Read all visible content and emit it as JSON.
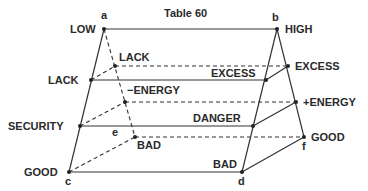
{
  "title": "Table 60",
  "points": {
    "a": "a",
    "b": "b",
    "c": "c",
    "d": "d",
    "e": "e",
    "f": "f"
  },
  "labels": {
    "low": "LOW",
    "high": "HIGH",
    "lack_front": "LACK",
    "lack_back": "LACK",
    "excess_front": "EXCESS",
    "excess_back": "EXCESS",
    "minus_energy": "−ENERGY",
    "plus_energy": "+ENERGY",
    "security": "SECURITY",
    "danger": "DANGER",
    "good_front": "GOOD",
    "bad_front": "BAD",
    "bad_back": "BAD",
    "good_back": "GOOD"
  }
}
